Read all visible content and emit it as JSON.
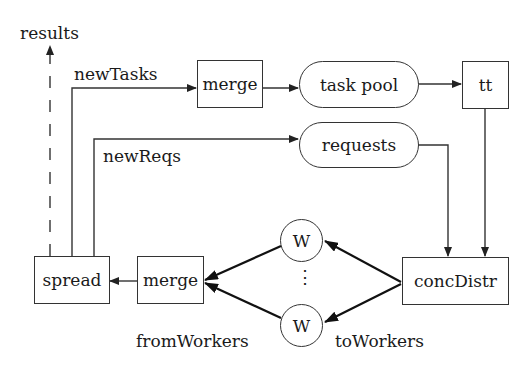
{
  "diagram": {
    "nodes": {
      "merge_top": {
        "label": "merge",
        "shape": "rectangle"
      },
      "task_pool": {
        "label": "task pool",
        "shape": "rounded"
      },
      "tt": {
        "label": "tt",
        "shape": "rectangle"
      },
      "requests": {
        "label": "requests",
        "shape": "rounded"
      },
      "spread": {
        "label": "spread",
        "shape": "rectangle"
      },
      "merge_bottom": {
        "label": "merge",
        "shape": "rectangle"
      },
      "worker_top": {
        "label": "W",
        "shape": "circle"
      },
      "worker_bottom": {
        "label": "W",
        "shape": "circle"
      },
      "conc_distr": {
        "label": "concDistr",
        "shape": "rectangle"
      }
    },
    "edge_labels": {
      "results": "results",
      "new_tasks": "newTasks",
      "new_reqs": "newReqs",
      "from_workers": "fromWorkers",
      "to_workers": "toWorkers"
    },
    "ellipsis": "⋮",
    "edges": [
      {
        "from": "spread",
        "to": "results",
        "style": "dashed",
        "label": "results"
      },
      {
        "from": "spread",
        "to": "merge_top",
        "label": "newTasks"
      },
      {
        "from": "merge_top",
        "to": "task_pool"
      },
      {
        "from": "task_pool",
        "to": "tt"
      },
      {
        "from": "tt",
        "to": "conc_distr"
      },
      {
        "from": "spread",
        "to": "requests",
        "label": "newReqs"
      },
      {
        "from": "requests",
        "to": "conc_distr"
      },
      {
        "from": "conc_distr",
        "to": "worker_top",
        "label": "toWorkers"
      },
      {
        "from": "conc_distr",
        "to": "worker_bottom",
        "label": "toWorkers"
      },
      {
        "from": "worker_top",
        "to": "merge_bottom",
        "label": "fromWorkers"
      },
      {
        "from": "worker_bottom",
        "to": "merge_bottom",
        "label": "fromWorkers"
      },
      {
        "from": "merge_bottom",
        "to": "spread"
      }
    ],
    "colors": {
      "stroke": "#333333",
      "text": "#1a1a1a",
      "background": "#ffffff"
    }
  }
}
